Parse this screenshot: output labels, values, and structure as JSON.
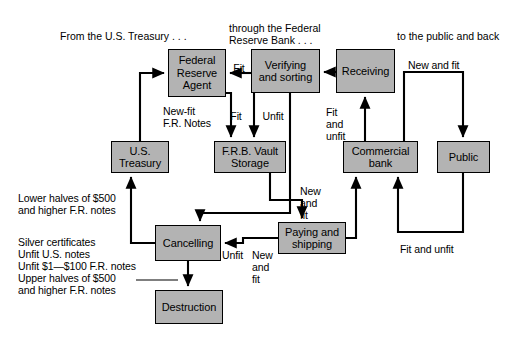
{
  "figure": {
    "type": "flowchart",
    "title_present": false,
    "background_color": "#ffffff",
    "node_fill_color": "#b3b3b3",
    "node_border_color": "#000000",
    "edge_color": "#000000"
  },
  "headings": [
    {
      "id": "hdr-treasury",
      "text": "From the U.S. Treasury . . .",
      "x": 60,
      "y": 30
    },
    {
      "id": "hdr-frb",
      "text": "through the Federal\nReserve Bank . . .",
      "x": 229,
      "y": 22
    },
    {
      "id": "hdr-public",
      "text": "to the public and back",
      "x": 397,
      "y": 30
    }
  ],
  "nodes": [
    {
      "id": "federal-reserve-agent",
      "label": "Federal\nReserve\nAgent",
      "x": 168,
      "y": 49,
      "w": 58,
      "h": 48
    },
    {
      "id": "verifying-and-sorting",
      "label": "Verifying\nand sorting",
      "x": 251,
      "y": 49,
      "w": 69,
      "h": 44
    },
    {
      "id": "receiving",
      "label": "Receiving",
      "x": 336,
      "y": 49,
      "w": 59,
      "h": 44
    },
    {
      "id": "us-treasury",
      "label": "U.S.\nTreasury",
      "x": 111,
      "y": 141,
      "w": 58,
      "h": 32
    },
    {
      "id": "frb-vault-storage",
      "label": "F.R.B. Vault\nStorage",
      "x": 214,
      "y": 141,
      "w": 72,
      "h": 32
    },
    {
      "id": "commercial-bank",
      "label": "Commercial\nbank",
      "x": 343,
      "y": 141,
      "w": 75,
      "h": 32
    },
    {
      "id": "public",
      "label": "Public",
      "x": 437,
      "y": 141,
      "w": 53,
      "h": 32
    },
    {
      "id": "cancelling",
      "label": "Cancelling",
      "x": 155,
      "y": 225,
      "w": 66,
      "h": 36
    },
    {
      "id": "paying-and-shipping",
      "label": "Paying and\nshipping",
      "x": 278,
      "y": 222,
      "w": 68,
      "h": 32
    },
    {
      "id": "destruction",
      "label": "Destruction",
      "x": 155,
      "y": 290,
      "w": 68,
      "h": 34
    }
  ],
  "edge_labels": [
    {
      "id": "lbl-fit-top",
      "text": "Fit",
      "x": 229,
      "y": 62,
      "align": "center",
      "w": 20
    },
    {
      "id": "lbl-new-fit-fr-notes",
      "text": "New-fit\nF.R. Notes",
      "x": 163,
      "y": 105,
      "align": "left",
      "w": 70
    },
    {
      "id": "lbl-fit",
      "text": "Fit",
      "x": 227,
      "y": 110,
      "align": "center",
      "w": 18
    },
    {
      "id": "lbl-unfit",
      "text": "Unfit",
      "x": 258,
      "y": 110,
      "align": "center",
      "w": 30
    },
    {
      "id": "lbl-fit-and-unfit-left",
      "text": "Fit\nand\nunfit",
      "x": 326,
      "y": 106,
      "align": "left",
      "w": 32
    },
    {
      "id": "lbl-new-and-fit-top",
      "text": "New and fit",
      "x": 408,
      "y": 59,
      "align": "left",
      "w": 70
    },
    {
      "id": "lbl-lower-halves",
      "text": "Lower halves of $500\nand higher F.R. notes",
      "x": 18,
      "y": 192,
      "align": "left",
      "w": 140
    },
    {
      "id": "lbl-unfit-cancel",
      "text": "Unfit",
      "x": 222,
      "y": 249,
      "align": "left",
      "w": 30
    },
    {
      "id": "lbl-new-and-fit-left",
      "text": "New\nand\nfit",
      "x": 252,
      "y": 249,
      "align": "left",
      "w": 28
    },
    {
      "id": "lbl-new-and-fit-mid",
      "text": "New\nand\nfit",
      "x": 300,
      "y": 185,
      "align": "left",
      "w": 30
    },
    {
      "id": "lbl-fit-and-unfit-bottom",
      "text": "Fit and unfit",
      "x": 400,
      "y": 243,
      "align": "left",
      "w": 80
    },
    {
      "id": "lbl-destruction-sources",
      "text": "Silver certificates\nUnfit U.S. notes\nUnfit $1—$100 F.R. notes\nUpper halves of $500\nand higher F.R. notes",
      "x": 18,
      "y": 236,
      "align": "left",
      "w": 150
    }
  ],
  "edges": [
    {
      "id": "edge-treasury-to-agent",
      "from": "us-treasury",
      "to": "federal-reserve-agent",
      "label": "New-fit F.R. Notes"
    },
    {
      "id": "edge-verifying-to-agent",
      "from": "verifying-and-sorting",
      "to": "federal-reserve-agent",
      "label": "Fit"
    },
    {
      "id": "edge-receiving-to-verifying",
      "from": "receiving",
      "to": "verifying-and-sorting",
      "label": ""
    },
    {
      "id": "edge-agent-to-vault",
      "from": "federal-reserve-agent",
      "to": "frb-vault-storage",
      "label": ""
    },
    {
      "id": "edge-verifying-to-vault",
      "from": "verifying-and-sorting",
      "to": "frb-vault-storage",
      "label": "Fit"
    },
    {
      "id": "edge-verifying-to-cancelling",
      "from": "verifying-and-sorting",
      "to": "cancelling",
      "label": "Unfit"
    },
    {
      "id": "edge-commercial-to-receiving",
      "from": "commercial-bank",
      "to": "receiving",
      "label": "Fit and unfit"
    },
    {
      "id": "edge-commercial-to-public",
      "from": "commercial-bank",
      "to": "public",
      "label": "New and fit"
    },
    {
      "id": "edge-public-to-commercial",
      "from": "public",
      "to": "commercial-bank",
      "label": "Fit and unfit"
    },
    {
      "id": "edge-vault-to-paying",
      "from": "frb-vault-storage",
      "to": "paying-and-shipping",
      "label": ""
    },
    {
      "id": "edge-paying-to-cancelling",
      "from": "paying-and-shipping",
      "to": "cancelling",
      "label": "Unfit"
    },
    {
      "id": "edge-paying-to-commercial",
      "from": "paying-and-shipping",
      "to": "commercial-bank",
      "label": "New and fit"
    },
    {
      "id": "edge-cancelling-to-treasury",
      "from": "cancelling",
      "to": "us-treasury",
      "label": "Lower halves of $500 and higher F.R. notes"
    },
    {
      "id": "edge-cancelling-to-destruction",
      "from": "cancelling",
      "to": "destruction",
      "label": ""
    }
  ]
}
